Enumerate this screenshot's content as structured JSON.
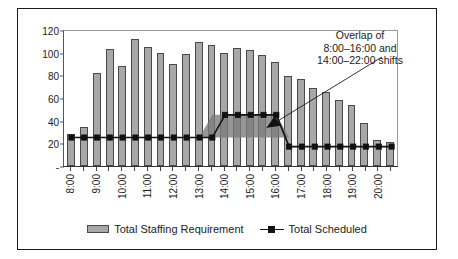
{
  "chart_data": {
    "type": "bar",
    "title": "",
    "subtitle": "",
    "xlabel": "",
    "ylabel": "",
    "ylim": [
      0,
      120
    ],
    "yticks": [
      120,
      100,
      80,
      60,
      40,
      20,
      0
    ],
    "ytick_labels": [
      "120",
      "100",
      "80",
      "60",
      "40",
      "20",
      "-"
    ],
    "grid": false,
    "legend_position": "bottom",
    "x": [
      "8:00",
      "8:30",
      "9:00",
      "9:30",
      "10:00",
      "10:30",
      "11:00",
      "11:30",
      "12:00",
      "12:30",
      "13:00",
      "13:30",
      "14:00",
      "14:30",
      "15:00",
      "15:30",
      "16:00",
      "16:30",
      "17:00",
      "17:30",
      "18:00",
      "18:30",
      "19:00",
      "19:30",
      "20:00",
      "20:30"
    ],
    "xtick_labels": [
      "8:00",
      "",
      "9:00",
      "",
      "10:00",
      "",
      "11:00",
      "",
      "12:00",
      "",
      "13:00",
      "",
      "14:00",
      "",
      "15:00",
      "",
      "16:00",
      "",
      "17:00",
      "",
      "18:00",
      "",
      "19:00",
      "",
      "20:00",
      ""
    ],
    "categories": [
      "8:00",
      "8:30",
      "9:00",
      "9:30",
      "10:00",
      "10:30",
      "11:00",
      "11:30",
      "12:00",
      "12:30",
      "13:00",
      "13:30",
      "14:00",
      "14:30",
      "15:00",
      "15:30",
      "16:00",
      "16:30",
      "17:00",
      "17:30",
      "18:00",
      "18:30",
      "19:00",
      "19:30",
      "20:00",
      "20:30"
    ],
    "series": [
      {
        "name": "Total Staffing Requirement",
        "type": "bar",
        "color": "#a8a8a8",
        "edge_color": "#4a4a4a",
        "values": [
          28,
          34,
          82,
          103,
          88,
          112,
          105,
          100,
          90,
          99,
          109,
          107,
          100,
          104,
          102,
          98,
          92,
          79,
          77,
          69,
          65,
          58,
          54,
          38,
          23,
          21
        ]
      },
      {
        "name": "Total Scheduled",
        "type": "line",
        "color": "#111111",
        "marker": "square",
        "values": [
          26,
          26,
          26,
          26,
          26,
          26,
          26,
          26,
          26,
          26,
          26,
          26,
          46,
          46,
          46,
          46,
          46,
          18,
          18,
          18,
          18,
          18,
          18,
          18,
          18,
          18
        ]
      }
    ],
    "annotations": [
      {
        "name": "overlap-note",
        "lines": [
          "Overlap of",
          "8:00–16:00 and",
          "14:00–22:00 shifts"
        ],
        "text": "Overlap of 8:00–16:00 and 14:00–22:00 shifts",
        "has_arrow": true,
        "points_to": "overlap-shaded-region"
      }
    ],
    "shaded_regions": [
      {
        "name": "overlap-shaded-region",
        "from": "13:30",
        "to": "16:00",
        "lower": 26,
        "upper": 46,
        "color": "#777777"
      }
    ]
  },
  "legend": {
    "items": [
      {
        "label": "Total Staffing Requirement",
        "marker": "bar-swatch",
        "color": "#a8a8a8"
      },
      {
        "label": "Total Scheduled",
        "marker": "line-square-swatch",
        "color": "#111111"
      }
    ]
  },
  "colors": {
    "bar_fill": "#a8a8a8",
    "bar_edge": "#4a4a4a",
    "line": "#111111",
    "overlap_fill": "#777777",
    "frame": "#1b1b1b",
    "text": "#1b1b1b"
  }
}
